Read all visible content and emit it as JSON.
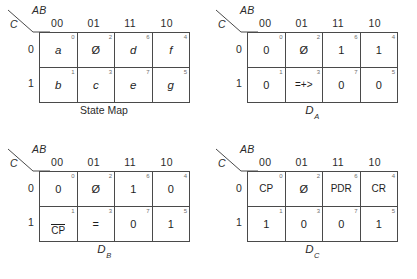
{
  "figure": {
    "axis_labels": {
      "columns": "AB",
      "rows": "C"
    },
    "column_headers": [
      "00",
      "01",
      "11",
      "10"
    ],
    "row_headers": [
      "0",
      "1"
    ],
    "minterms": {
      "row0": [
        "0",
        "2",
        "6",
        "4"
      ],
      "row1": [
        "1",
        "3",
        "7",
        "5"
      ]
    }
  },
  "maps": [
    {
      "id": "state-map",
      "caption": "State Map",
      "caption_base": "",
      "caption_sub": "",
      "cells": {
        "row0": [
          "a",
          "Ø",
          "d",
          "f"
        ],
        "row1": [
          "b",
          "c",
          "e",
          "g"
        ]
      }
    },
    {
      "id": "da-map",
      "caption": "",
      "caption_base": "D",
      "caption_sub": "A",
      "cells": {
        "row0": [
          "0",
          "Ø",
          "1",
          "1"
        ],
        "row1": [
          "0",
          "=+>",
          "0",
          "0"
        ]
      }
    },
    {
      "id": "db-map",
      "caption": "",
      "caption_base": "D",
      "caption_sub": "B",
      "cells": {
        "row0": [
          "0",
          "Ø",
          "1",
          "0"
        ],
        "row1": [
          "CP",
          "=",
          "0",
          "1"
        ]
      }
    },
    {
      "id": "dc-map",
      "caption": "",
      "caption_base": "D",
      "caption_sub": "C",
      "cells": {
        "row0": [
          "CP",
          "Ø",
          "PDR",
          "CR"
        ],
        "row1": [
          "1",
          "0",
          "0",
          "1"
        ]
      }
    }
  ],
  "colors": {
    "grid_line": "#4a4a4a",
    "text": "#1e1e1e",
    "minterm_text": "#6e6e6e",
    "background": "#ffffff"
  }
}
